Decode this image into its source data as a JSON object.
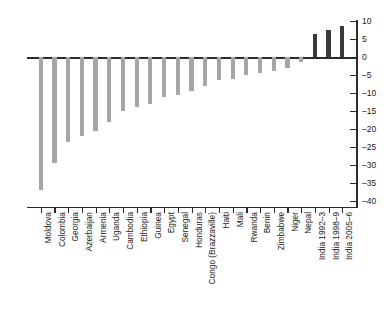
{
  "chart_data": {
    "type": "bar",
    "title": "",
    "subtitle": "",
    "xlabel": "",
    "ylabel": "",
    "ylim": [
      -40,
      10
    ],
    "ytick_step": 5,
    "grid": false,
    "legend": "none",
    "orientation": "vertical",
    "ytick_labels": [
      "10",
      "5",
      "0",
      "-5",
      "-10",
      "-15",
      "-20",
      "-25",
      "-30",
      "-35",
      "-40"
    ],
    "ytick_values": [
      10,
      5,
      0,
      -5,
      -10,
      -15,
      -20,
      -25,
      -30,
      -35,
      -40
    ],
    "categories": [
      "Moldova",
      "Colombia",
      "Georgia",
      "Azerbaijan",
      "Armenia",
      "Uganda",
      "Cambodia",
      "Ethiopia",
      "Guinea",
      "Egypt",
      "Senegal",
      "Honduras",
      "Congo (Brazzaville)",
      "Haiti",
      "Mali",
      "Rwanda",
      "Benin",
      "Zimbabwe",
      "Niger",
      "Nepal",
      "India 1992–3",
      "India 1998–9",
      "India 2005–6"
    ],
    "values": [
      -37.0,
      -29.5,
      -23.5,
      -22.0,
      -20.5,
      -18.0,
      -15.0,
      -14.0,
      -13.0,
      -11.0,
      -10.5,
      -9.5,
      -8.0,
      -6.5,
      -6.0,
      -5.0,
      -4.5,
      -4.0,
      -3.0,
      -1.5,
      6.5,
      7.5,
      8.5
    ],
    "bar_colors": {
      "negative": "#a6a6a6",
      "positive": "#3a3a3a"
    },
    "axis_color": "#2b2b2b"
  }
}
